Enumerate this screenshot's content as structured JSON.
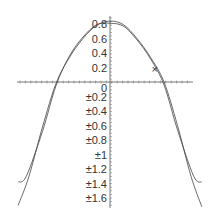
{
  "chart_data": {
    "type": "line",
    "title": "",
    "xlabel": "",
    "ylabel": "",
    "grid": false,
    "legend": null,
    "xlim": [
      -1.7,
      1.55
    ],
    "ylim": [
      -1.7,
      0.9
    ],
    "y_tick_labels": [
      "0.8",
      "0.6",
      "0.4",
      "0.2",
      "0",
      "±0.2",
      "±0.4",
      "±0.6",
      "±0.8",
      "±1",
      "±1.2",
      "±1.4",
      "±1.6"
    ],
    "y_tick_values": [
      0.8,
      0.6,
      0.4,
      0.2,
      0,
      -0.2,
      -0.4,
      -0.6,
      -0.8,
      -1.0,
      -1.2,
      -1.4,
      -1.6
    ],
    "series": [
      {
        "name": "curve-1",
        "x": [
          -1.7,
          -1.5,
          -1.25,
          -1.0,
          -0.75,
          -0.5,
          -0.25,
          0,
          0.25,
          0.5,
          0.75,
          1.0,
          1.25,
          1.5,
          1.7
        ],
        "y": [
          -1.7,
          -1.3,
          -0.62,
          -0.02,
          0.34,
          0.6,
          0.78,
          0.84,
          0.79,
          0.6,
          0.34,
          0.0,
          -0.6,
          -1.3,
          -1.72
        ]
      },
      {
        "name": "curve-2",
        "x": [
          -1.7,
          -1.55,
          -1.25,
          -1.0,
          -0.75,
          -0.5,
          -0.25,
          0,
          0.25,
          0.5,
          0.75,
          1.0,
          1.25,
          1.55,
          1.7
        ],
        "y": [
          -1.38,
          -1.3,
          -0.68,
          -0.05,
          0.36,
          0.62,
          0.79,
          0.81,
          0.77,
          0.58,
          0.32,
          -0.04,
          -0.66,
          -1.3,
          -1.38
        ]
      }
    ],
    "annotations": [
      {
        "text": "×",
        "x": 0.83,
        "y": 0.16
      }
    ]
  }
}
